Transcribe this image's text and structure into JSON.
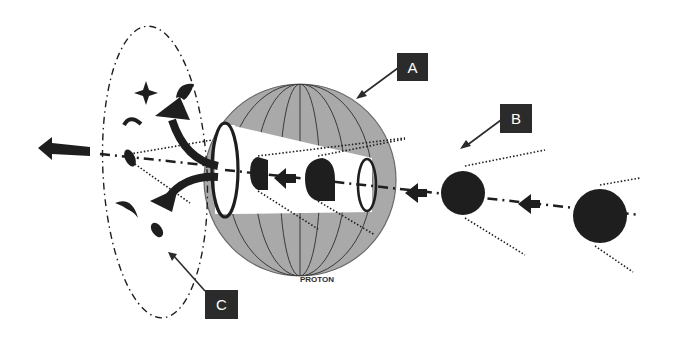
{
  "diagram": {
    "type": "physics-illustration",
    "target_label": "PROTON",
    "callouts": [
      {
        "id": "A",
        "label": "A",
        "points_to": "proton sphere surface"
      },
      {
        "id": "B",
        "label": "B",
        "points_to": "incoming projectile sphere"
      },
      {
        "id": "C",
        "label": "C",
        "points_to": "fragment/debris region"
      }
    ],
    "colors": {
      "background": "#ffffff",
      "proton_fill": "#a9a9a9",
      "ink": "#1e1e1e",
      "label_box": "#2b2b2b",
      "label_text": "#ffffff"
    }
  }
}
